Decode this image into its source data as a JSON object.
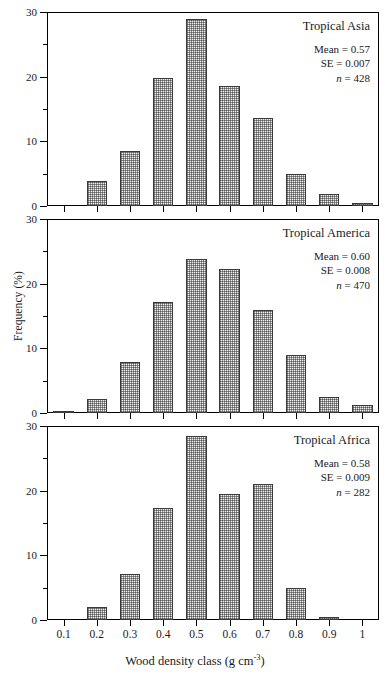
{
  "figure": {
    "xlabel_main": "Wood density class (g cm",
    "xlabel_sup": "-3",
    "xlabel_tail": ")",
    "ylabel": "Frequency (%)"
  },
  "axes": {
    "y_ticks_major": [
      "0",
      "10",
      "20",
      "30"
    ],
    "y_major_values": [
      0,
      10,
      20,
      30
    ],
    "y_minor_values": [
      5,
      15,
      25
    ],
    "ylim": [
      0,
      30
    ],
    "x_tick_labels": [
      "0.1",
      "0.2",
      "0.3",
      "0.4",
      "0.5",
      "0.6",
      "0.7",
      "0.8",
      "0.9",
      "1"
    ]
  },
  "panels": [
    {
      "id": "asia",
      "region": "Tropical Asia",
      "mean_label": "Mean = 0.57",
      "se_label": "SE = 0.007",
      "n_prefix": "n",
      "n_label": " = 428"
    },
    {
      "id": "america",
      "region": "Tropical America",
      "mean_label": "Mean = 0.60",
      "se_label": "SE = 0.008",
      "n_prefix": "n",
      "n_label": " = 470"
    },
    {
      "id": "africa",
      "region": "Tropical Africa",
      "mean_label": "Mean = 0.58",
      "se_label": "SE = 0.009",
      "n_prefix": "n",
      "n_label": " = 282"
    }
  ],
  "chart_data": [
    {
      "type": "bar",
      "title": "Tropical Asia",
      "xlabel": "Wood density class (g cm-3)",
      "ylabel": "Frequency (%)",
      "categories": [
        "0.1",
        "0.2",
        "0.3",
        "0.4",
        "0.5",
        "0.6",
        "0.7",
        "0.8",
        "0.9",
        "1"
      ],
      "values": [
        0,
        3.9,
        8.5,
        19.8,
        28.9,
        18.6,
        13.6,
        5.0,
        1.8,
        0.4
      ],
      "ylim": [
        0,
        30
      ],
      "grid": false,
      "legend": "none",
      "annotations": [
        "Mean = 0.57",
        "SE = 0.007",
        "n = 428"
      ]
    },
    {
      "type": "bar",
      "title": "Tropical America",
      "xlabel": "Wood density class (g cm-3)",
      "ylabel": "Frequency (%)",
      "categories": [
        "0.1",
        "0.2",
        "0.3",
        "0.4",
        "0.5",
        "0.6",
        "0.7",
        "0.8",
        "0.9",
        "1"
      ],
      "values": [
        0.2,
        2.1,
        7.9,
        17.2,
        23.8,
        22.3,
        15.9,
        9.0,
        2.5,
        1.3
      ],
      "ylim": [
        0,
        30
      ],
      "grid": false,
      "legend": "none",
      "annotations": [
        "Mean = 0.60",
        "SE = 0.008",
        "n = 470"
      ]
    },
    {
      "type": "bar",
      "title": "Tropical Africa",
      "xlabel": "Wood density class (g cm-3)",
      "ylabel": "Frequency (%)",
      "categories": [
        "0.1",
        "0.2",
        "0.3",
        "0.4",
        "0.5",
        "0.6",
        "0.7",
        "0.8",
        "0.9",
        "1"
      ],
      "values": [
        0,
        2.0,
        7.1,
        17.3,
        28.4,
        19.5,
        21.0,
        5.0,
        0.5,
        0
      ],
      "ylim": [
        0,
        30
      ],
      "grid": false,
      "legend": "none",
      "annotations": [
        "Mean = 0.58",
        "SE = 0.009",
        "n = 282"
      ]
    }
  ]
}
